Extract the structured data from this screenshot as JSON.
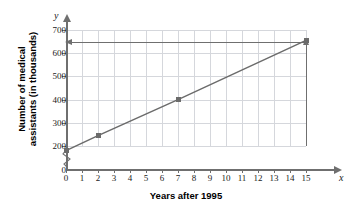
{
  "chart_data": {
    "type": "line",
    "title": "",
    "xlabel": "Years after 1995",
    "ylabel_line1": "Number of medical",
    "ylabel_line2": "assistants (in thousands)",
    "x_axis_letter": "x",
    "y_axis_letter": "y",
    "xlim": [
      0,
      15
    ],
    "ylim": [
      200,
      700
    ],
    "y_axis_break": true,
    "y_origin_label": "0",
    "grid": true,
    "legend": "none",
    "x_ticks": [
      "0",
      "1",
      "2",
      "3",
      "4",
      "5",
      "6",
      "7",
      "8",
      "9",
      "10",
      "11",
      "12",
      "13",
      "14",
      "15"
    ],
    "y_ticks": [
      "200",
      "300",
      "400",
      "500",
      "600",
      "700"
    ],
    "x": [
      0,
      2,
      7,
      15
    ],
    "values": [
      180,
      245,
      400,
      655
    ],
    "points": [
      {
        "x": 0,
        "y": 180
      },
      {
        "x": 2,
        "y": 245
      },
      {
        "x": 7,
        "y": 400
      },
      {
        "x": 15,
        "y": 655
      }
    ],
    "annotations": [
      {
        "name": "horizontal-reference-arrow",
        "y": 650,
        "from_x": 15,
        "to_x": 0,
        "direction": "left"
      },
      {
        "name": "vertical-reference-arrow",
        "x": 15,
        "from_y": 200,
        "to_y": 640,
        "direction": "up"
      }
    ],
    "colors": {
      "line": "#6b6b6b",
      "marker": "#6b6b6b",
      "grid": "#d5d7dc",
      "axis": "#6f6f6f",
      "text": "#1a1a1a",
      "background": "#ffffff"
    }
  }
}
